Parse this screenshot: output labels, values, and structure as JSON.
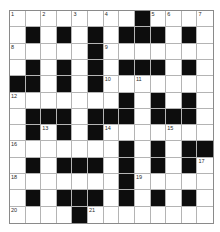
{
  "puzzle": {
    "rows": 13,
    "cols": 13,
    "colors": {
      "black": "#0d0d0d",
      "white": "#ffffff",
      "gridline": "#b4b4b4",
      "border": "#8a8a8a",
      "number": "#2a2a2a"
    },
    "layout": [
      "........#....",
      ".#.#.#.###.#.",
      ".....#.......",
      ".#.#.#.###.#.",
      "##.#.#.......",
      ".......#.#.#.",
      ".###.###.###.",
      ".#.#.#.......",
      ".......#.#.##",
      ".#.###.#.#.#.",
      ".......#.....",
      ".#.###.#.#.#.",
      "....#........"
    ],
    "numbers": [
      {
        "n": "1",
        "r": 0,
        "c": 0
      },
      {
        "n": "2",
        "r": 0,
        "c": 2
      },
      {
        "n": "3",
        "r": 0,
        "c": 4
      },
      {
        "n": "4",
        "r": 0,
        "c": 6
      },
      {
        "n": "5",
        "r": 0,
        "c": 9
      },
      {
        "n": "6",
        "r": 0,
        "c": 10
      },
      {
        "n": "7",
        "r": 0,
        "c": 12
      },
      {
        "n": "8",
        "r": 2,
        "c": 0
      },
      {
        "n": "9",
        "r": 2,
        "c": 6
      },
      {
        "n": "10",
        "r": 4,
        "c": 6
      },
      {
        "n": "11",
        "r": 4,
        "c": 8
      },
      {
        "n": "12",
        "r": 5,
        "c": 0
      },
      {
        "n": "13",
        "r": 7,
        "c": 2
      },
      {
        "n": "14",
        "r": 7,
        "c": 6
      },
      {
        "n": "15",
        "r": 7,
        "c": 10
      },
      {
        "n": "16",
        "r": 8,
        "c": 0
      },
      {
        "n": "17",
        "r": 9,
        "c": 12
      },
      {
        "n": "18",
        "r": 10,
        "c": 0
      },
      {
        "n": "19",
        "r": 10,
        "c": 8
      },
      {
        "n": "20",
        "r": 12,
        "c": 0
      },
      {
        "n": "21",
        "r": 12,
        "c": 5
      }
    ]
  }
}
